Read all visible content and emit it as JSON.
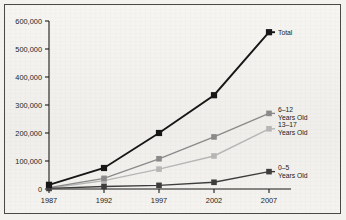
{
  "chart_data": {
    "type": "line",
    "title": "",
    "xlabel": "",
    "ylabel": "",
    "x": [
      1987,
      1992,
      1997,
      2002,
      2007
    ],
    "categories": [
      "1987",
      "1992",
      "1997",
      "2002",
      "2007"
    ],
    "xtick_labels": [
      "1987",
      "1992",
      "1997",
      "2002",
      "2007"
    ],
    "ytick_labels": [
      "0",
      "100,000",
      "200,000",
      "300,000",
      "400,000",
      "500,000",
      "600,000"
    ],
    "ytick_values": [
      0,
      100000,
      200000,
      300000,
      400000,
      500000,
      600000
    ],
    "ylim": [
      0,
      600000
    ],
    "xlim": [
      1987,
      2007
    ],
    "grid": false,
    "legend_position": "right-inline",
    "series": [
      {
        "name": "Total",
        "label_line1": "Total",
        "label_line2": "",
        "color": "#171717",
        "marker": "square",
        "values": [
          15000,
          75000,
          200000,
          335000,
          560000
        ]
      },
      {
        "name": "6-12 Years Old",
        "label_line1": "6–12",
        "label_line2": "Years Old",
        "color": "#8a8a8a",
        "marker": "square",
        "values": [
          5000,
          38000,
          108000,
          186000,
          270000
        ]
      },
      {
        "name": "13-17 Years Old",
        "label_line1": "13–17",
        "label_line2": "Years Old",
        "color": "#b6b6b6",
        "marker": "square",
        "values": [
          3000,
          30000,
          71000,
          118000,
          215000
        ]
      },
      {
        "name": "0-5 Years Old",
        "label_line1": "0–5",
        "label_line2": "Years Old",
        "color": "#3d3d3d",
        "marker": "square",
        "values": [
          2000,
          9000,
          13000,
          24000,
          62000
        ]
      }
    ]
  },
  "style": {
    "page_background": "#f3f2ef",
    "frame_border": "#4a4a48",
    "axis_color": "#1a1a1a",
    "text_color": "#1c1c1c"
  }
}
